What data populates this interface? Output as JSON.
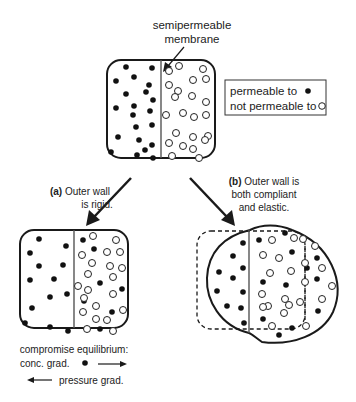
{
  "title_label": {
    "line1": "semipermeable",
    "line2": "membrane"
  },
  "legend": {
    "permeable_label": "permeable to",
    "permeable_symbol": "filled-dot",
    "not_permeable_label": "not permeable to",
    "not_permeable_symbol": "open-dot"
  },
  "branch_a": {
    "prefix": "(a)",
    "line1": " Outer wall",
    "line2": "is rigid."
  },
  "branch_b": {
    "prefix": "(b)",
    "line1": " Outer wall is",
    "line2": "both compliant",
    "line3": "and elastic."
  },
  "caption_a": {
    "line1": "compromise equilibrium:",
    "line2": "conc. grad.",
    "line3": "pressure grad."
  },
  "colors": {
    "stroke": "#1a1a1a",
    "membrane": "#555555",
    "filled_dot": "#111111",
    "background": "#ffffff"
  },
  "diagrams": {
    "initial": {
      "description": "Filled solute on left, open solute on right, separated by membrane; rigid rounded box",
      "filled_count": 21,
      "open_count": 23
    },
    "rigid": {
      "description": "Filled solute diffuses across membrane; open stays right; pressure builds",
      "filled_count": 20,
      "open_count": 24
    },
    "elastic": {
      "description": "Wall bulges into a circle; dashed outline shows original wall and shifted membrane position",
      "filled_count": 22,
      "open_count": 22
    }
  }
}
